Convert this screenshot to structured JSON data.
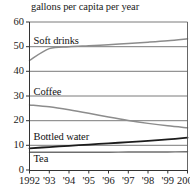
{
  "chart_data": {
    "type": "line",
    "title": "gallons per capita per year",
    "xlabel": "",
    "ylabel": "",
    "x": [
      1992,
      1993,
      1994,
      1995,
      1996,
      1997,
      1998,
      1999,
      2000
    ],
    "xtick_labels": [
      "1992",
      "'93",
      "'94",
      "'95",
      "'96",
      "'97",
      "'98",
      "'99",
      "2000"
    ],
    "ytick_labels": [
      "0",
      "10",
      "20",
      "30",
      "40",
      "50",
      "60"
    ],
    "ytick_values": [
      0,
      10,
      20,
      30,
      40,
      50,
      60
    ],
    "xlim": [
      1992,
      2000
    ],
    "ylim": [
      0,
      60
    ],
    "grid": "horizontal",
    "legend_position": "inline-labels",
    "series": [
      {
        "name": "Soft drinks",
        "color": "#8c8c8c",
        "width": 1.5,
        "label_x": 1992.15,
        "label_y": 52.2,
        "values": [
          44.4,
          49.2,
          50.0,
          50.4,
          50.8,
          51.3,
          51.8,
          52.4,
          53.2
        ]
      },
      {
        "name": "Coffee",
        "color": "#8c8c8c",
        "width": 1.5,
        "label_x": 1992.15,
        "label_y": 31.6,
        "values": [
          26.4,
          25.6,
          24.4,
          23.0,
          21.5,
          20.1,
          18.9,
          17.9,
          17.1
        ]
      },
      {
        "name": "Bottled water",
        "color": "#1c1c1c",
        "width": 1.8,
        "label_x": 1992.15,
        "label_y": 13.4,
        "values": [
          8.8,
          9.3,
          9.8,
          10.3,
          10.8,
          11.3,
          11.8,
          12.4,
          13.1
        ]
      },
      {
        "name": "Tea",
        "color": "#6e6e6e",
        "width": 1.4,
        "label_x": 1992.15,
        "label_y": 4.6,
        "values": [
          7.2,
          7.2,
          7.2,
          7.2,
          7.2,
          7.3,
          7.3,
          7.3,
          7.4
        ]
      }
    ]
  }
}
